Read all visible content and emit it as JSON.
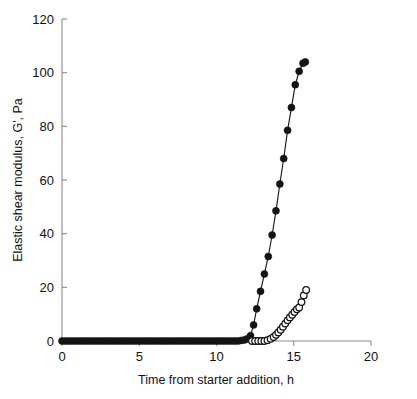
{
  "chart_data": {
    "type": "line",
    "title": "",
    "subtitle": "",
    "xlabel": "Time from starter addition, h",
    "ylabel": "Elastic shear modulus, G', Pa",
    "xlim": [
      0,
      20
    ],
    "ylim": [
      0,
      120
    ],
    "xticks": [
      0,
      5,
      10,
      15,
      20
    ],
    "yticks": [
      0,
      20,
      40,
      60,
      80,
      100,
      120
    ],
    "xtick_labels": [
      "0",
      "5",
      "10",
      "15",
      "20"
    ],
    "ytick_labels": [
      "0",
      "20",
      "40",
      "60",
      "80",
      "100",
      "120"
    ],
    "grid": false,
    "legend": "none",
    "series": [
      {
        "name": "filled-circles",
        "marker": "filled circle",
        "color": "#141414",
        "x": [
          0.0,
          0.2,
          0.4,
          0.6,
          0.8,
          1.0,
          1.2,
          1.4,
          1.6,
          1.8,
          2.0,
          2.2,
          2.4,
          2.6,
          2.8,
          3.0,
          3.2,
          3.4,
          3.6,
          3.8,
          4.0,
          4.2,
          4.4,
          4.6,
          4.8,
          5.0,
          5.2,
          5.4,
          5.6,
          5.8,
          6.0,
          6.2,
          6.4,
          6.6,
          6.8,
          7.0,
          7.2,
          7.4,
          7.6,
          7.8,
          8.0,
          8.2,
          8.4,
          8.6,
          8.8,
          9.0,
          9.2,
          9.4,
          9.6,
          9.8,
          10.0,
          10.2,
          10.4,
          10.6,
          10.8,
          11.0,
          11.2,
          11.4,
          11.6,
          11.8,
          12.0,
          12.2,
          12.4,
          12.6,
          12.85,
          13.1,
          13.35,
          13.6,
          13.85,
          14.1,
          14.35,
          14.6,
          14.85,
          15.1,
          15.35,
          15.6,
          15.75
        ],
        "y": [
          0.0,
          0.0,
          0.0,
          0.0,
          0.0,
          0.0,
          0.0,
          0.0,
          0.0,
          0.0,
          0.0,
          0.0,
          0.0,
          0.0,
          0.0,
          0.0,
          0.0,
          0.0,
          0.0,
          0.0,
          0.0,
          0.0,
          0.0,
          0.0,
          0.0,
          0.0,
          0.0,
          0.0,
          0.0,
          0.0,
          0.0,
          0.0,
          0.0,
          0.0,
          0.0,
          0.0,
          0.0,
          0.0,
          0.0,
          0.0,
          0.0,
          0.0,
          0.0,
          0.0,
          0.0,
          0.0,
          0.0,
          0.0,
          0.0,
          0.0,
          0.0,
          0.0,
          0.0,
          0.0,
          0.0,
          0.0,
          0.0,
          0.0,
          0.2,
          0.4,
          0.8,
          2.0,
          6.0,
          12.0,
          18.5,
          25.0,
          31.5,
          39.5,
          48.5,
          58.5,
          68.0,
          78.5,
          87.0,
          95.5,
          100.5,
          103.5,
          104.0
        ]
      },
      {
        "name": "open-circles",
        "marker": "open circle",
        "color": "#141414",
        "x": [
          12.3,
          12.5,
          12.7,
          12.9,
          13.1,
          13.3,
          13.5,
          13.7,
          13.85,
          14.0,
          14.15,
          14.3,
          14.45,
          14.6,
          14.75,
          14.9,
          15.05,
          15.2,
          15.35,
          15.5,
          15.65,
          15.8
        ],
        "y": [
          0.0,
          0.0,
          0.0,
          0.0,
          0.0,
          0.3,
          0.8,
          1.5,
          2.3,
          3.2,
          4.2,
          5.3,
          6.5,
          7.7,
          8.8,
          9.8,
          10.8,
          11.8,
          12.5,
          14.5,
          17.0,
          19.0
        ]
      }
    ]
  },
  "axes": {
    "y_axis_title": "Elastic shear modulus, G', Pa",
    "x_axis_title": "Time from starter addition, h"
  }
}
